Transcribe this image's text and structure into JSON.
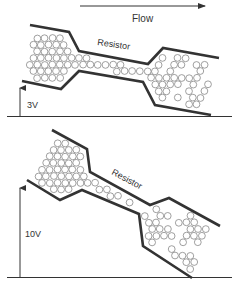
{
  "flow": {
    "label": "Flow",
    "direction": "left-to-right"
  },
  "panels": [
    {
      "id": "low-voltage",
      "resistor_label": "Resistor",
      "voltage_label": "3V",
      "voltage_value": 3
    },
    {
      "id": "high-voltage",
      "resistor_label": "Resistor",
      "voltage_label": "10V",
      "voltage_value": 10
    }
  ],
  "colors": {
    "wall": "#333333",
    "particle_stroke": "#888888",
    "axis": "#333333",
    "text": "#333333"
  }
}
